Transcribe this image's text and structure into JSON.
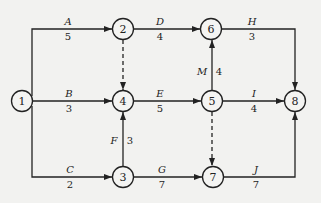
{
  "diagram": {
    "type": "activity-on-arrow network",
    "nodes": [
      {
        "id": "1",
        "label": "1",
        "x": 22,
        "y": 101
      },
      {
        "id": "2",
        "label": "2",
        "x": 123,
        "y": 29
      },
      {
        "id": "3",
        "label": "3",
        "x": 123,
        "y": 177
      },
      {
        "id": "4",
        "label": "4",
        "x": 123,
        "y": 101
      },
      {
        "id": "5",
        "label": "5",
        "x": 212,
        "y": 101
      },
      {
        "id": "6",
        "label": "6",
        "x": 211,
        "y": 29
      },
      {
        "id": "7",
        "label": "7",
        "x": 213,
        "y": 177
      },
      {
        "id": "8",
        "label": "8",
        "x": 295,
        "y": 101
      }
    ],
    "activities": [
      {
        "name": "A",
        "duration": "5",
        "from": "1",
        "to": "2"
      },
      {
        "name": "B",
        "duration": "3",
        "from": "1",
        "to": "4"
      },
      {
        "name": "C",
        "duration": "2",
        "from": "1",
        "to": "3"
      },
      {
        "name": "D",
        "duration": "4",
        "from": "2",
        "to": "6"
      },
      {
        "name": "E",
        "duration": "5",
        "from": "4",
        "to": "5"
      },
      {
        "name": "F",
        "duration": "3",
        "from": "3",
        "to": "4"
      },
      {
        "name": "G",
        "duration": "7",
        "from": "3",
        "to": "7"
      },
      {
        "name": "H",
        "duration": "3",
        "from": "6",
        "to": "8"
      },
      {
        "name": "I",
        "duration": "4",
        "from": "5",
        "to": "8"
      },
      {
        "name": "J",
        "duration": "7",
        "from": "7",
        "to": "8"
      },
      {
        "name": "M",
        "duration": "4",
        "from": "5",
        "to": "6"
      }
    ],
    "dummies": [
      {
        "from": "2",
        "to": "4"
      },
      {
        "from": "5",
        "to": "7"
      }
    ]
  }
}
